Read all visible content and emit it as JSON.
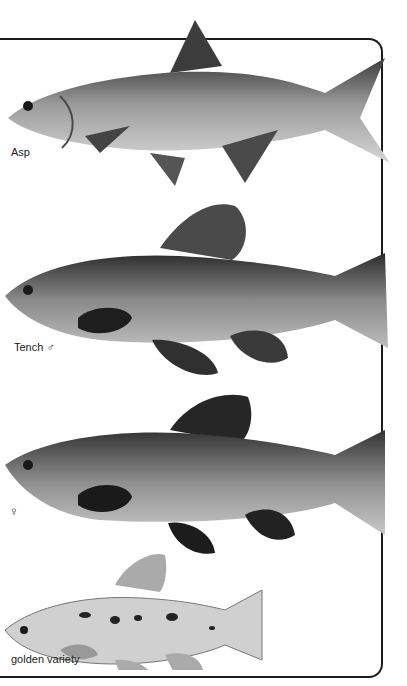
{
  "plate": {
    "entries": [
      {
        "id": "asp",
        "label": "Asp"
      },
      {
        "id": "tench-male",
        "label": "Tench ♂"
      },
      {
        "id": "tench-female",
        "label": "♀"
      },
      {
        "id": "tench-golden",
        "label": "golden variety"
      }
    ]
  },
  "colors": {
    "background": "#ffffff",
    "frame": "#1c1c1c",
    "fish_body": "#9a9a9a",
    "fish_dark": "#2a2a2a",
    "fish_light": "#d8d8d8"
  }
}
